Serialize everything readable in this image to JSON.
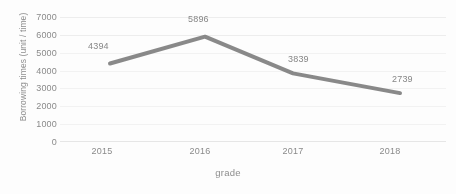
{
  "chart_data": {
    "type": "line",
    "title": "",
    "xlabel": "grade",
    "ylabel": "Borrowing times (unit / time)",
    "categories": [
      "2015",
      "2016",
      "2017",
      "2018"
    ],
    "values": [
      4394,
      5896,
      3839,
      2739
    ],
    "data_labels": [
      "4394",
      "5896",
      "3839",
      "2739"
    ],
    "ylim": [
      0,
      7000
    ],
    "ytick_labels": [
      "7000",
      "6000",
      "5000",
      "4000",
      "3000",
      "2000",
      "1000",
      "0"
    ],
    "ytick_values": [
      7000,
      6000,
      5000,
      4000,
      3000,
      2000,
      1000,
      0
    ],
    "grid": true,
    "legend": "none",
    "series": [
      {
        "name": "Borrowing times",
        "values": [
          4394,
          5896,
          3839,
          2739
        ],
        "color": "#7f7f7f",
        "line_width": 4
      }
    ],
    "colors": {
      "line": "#7f7f7f",
      "gridline": "#ededed",
      "axis_text": "#8a8a8a",
      "label_text": "#868686",
      "background": "#fdfdfd"
    }
  }
}
